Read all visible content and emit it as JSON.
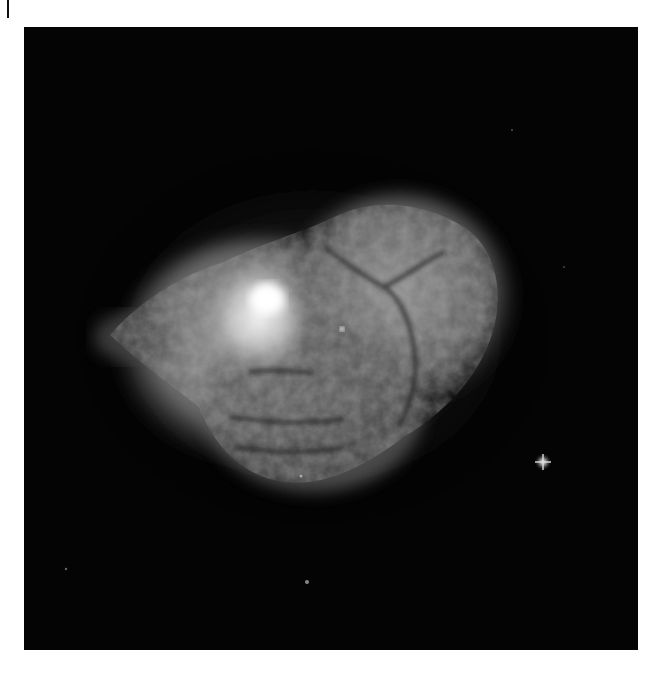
{
  "image": {
    "subject": "planetary nebula",
    "description": "Grayscale astronomical image of a bipolar planetary nebula with mottled, cellular lobes on a black starfield",
    "colors": {
      "background": "#040404",
      "page": "#ffffff",
      "nebula_core": "#e8e8e8",
      "nebula_mid": "#8a8a8a"
    }
  }
}
